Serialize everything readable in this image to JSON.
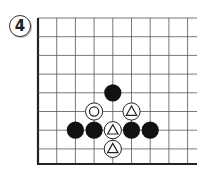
{
  "problem": {
    "number": "4"
  },
  "board": {
    "origin_x": 38,
    "origin_y": 18,
    "spacing": 18.7,
    "cols": 9,
    "rows": 8,
    "bottom_y": 164,
    "right_x": 197,
    "line_color": "#555555",
    "border_color": "#222222"
  },
  "stones": [
    {
      "color": "black",
      "col": 4,
      "row": 4,
      "mark": null
    },
    {
      "color": "white",
      "col": 3,
      "row": 5,
      "mark": "circle"
    },
    {
      "color": "white",
      "col": 5,
      "row": 5,
      "mark": "triangle"
    },
    {
      "color": "black",
      "col": 2,
      "row": 6,
      "mark": null
    },
    {
      "color": "black",
      "col": 3,
      "row": 6,
      "mark": null
    },
    {
      "color": "white",
      "col": 4,
      "row": 6,
      "mark": "triangle"
    },
    {
      "color": "black",
      "col": 5,
      "row": 6,
      "mark": null
    },
    {
      "color": "black",
      "col": 6,
      "row": 6,
      "mark": null
    },
    {
      "color": "white",
      "col": 4,
      "row": 7,
      "mark": "triangle"
    }
  ]
}
